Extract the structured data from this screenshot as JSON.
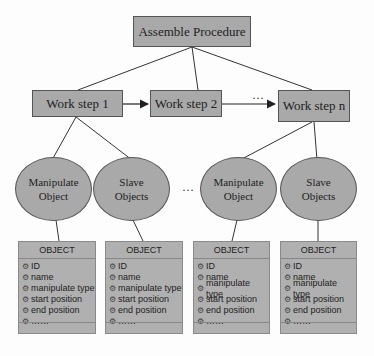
{
  "diagram": {
    "root": {
      "label": "Assemble Procedure"
    },
    "steps": [
      {
        "label": "Work step 1"
      },
      {
        "label": "Work step 2"
      },
      {
        "label": "Work step n"
      }
    ],
    "step_ellipsis": "…",
    "object_ellipsis": "…",
    "object_groups": [
      {
        "label_line1": "Manipulate",
        "label_line2": "Object"
      },
      {
        "label_line1": "Slave",
        "label_line2": "Objects"
      },
      {
        "label_line1": "Manipulate",
        "label_line2": "Object"
      },
      {
        "label_line1": "Slave",
        "label_line2": "Objects"
      }
    ],
    "object_tables": [
      {
        "title": "OBJECT",
        "attributes": [
          "ID",
          "name",
          "manipulate type",
          "start position",
          "end position",
          "……"
        ]
      },
      {
        "title": "OBJECT",
        "attributes": [
          "ID",
          "name",
          "manipulate type",
          "start position",
          "end position",
          "……"
        ]
      },
      {
        "title": "OBJECT",
        "attributes": [
          "ID",
          "name",
          "manipulate type",
          "start position",
          "end position",
          "……"
        ]
      },
      {
        "title": "OBJECT",
        "attributes": [
          "ID",
          "name",
          "manipulate type",
          "start position",
          "end position",
          "……"
        ]
      }
    ],
    "attribute_icon": "attribute-icon",
    "colors": {
      "node_fill": "#a9a9a9",
      "border": "#555555",
      "table_fill": "#b0b0b0"
    }
  }
}
